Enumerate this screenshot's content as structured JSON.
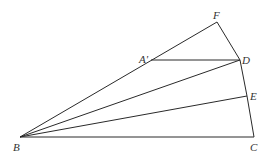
{
  "diagram": {
    "type": "geometry",
    "line_color": "#2a2a2a",
    "label_color": "#333333",
    "points": {
      "B": {
        "label": "B",
        "x": 20,
        "y": 137,
        "lx": 13,
        "ly": 151
      },
      "C": {
        "label": "C",
        "x": 254,
        "y": 137,
        "lx": 250,
        "ly": 151
      },
      "E": {
        "label": "E",
        "x": 247,
        "y": 96,
        "lx": 250,
        "ly": 100
      },
      "D": {
        "label": "D",
        "x": 240,
        "y": 60,
        "lx": 242,
        "ly": 64
      },
      "F": {
        "label": "F",
        "x": 217,
        "y": 22,
        "lx": 213,
        "ly": 19
      },
      "A1": {
        "label": "A'",
        "x": 151,
        "y": 60,
        "lx": 139,
        "ly": 63
      }
    },
    "segments": [
      [
        "B",
        "C"
      ],
      [
        "C",
        "E"
      ],
      [
        "E",
        "D"
      ],
      [
        "D",
        "F"
      ],
      [
        "B",
        "F"
      ],
      [
        "A1",
        "D"
      ],
      [
        "B",
        "D"
      ],
      [
        "B",
        "E"
      ]
    ]
  }
}
